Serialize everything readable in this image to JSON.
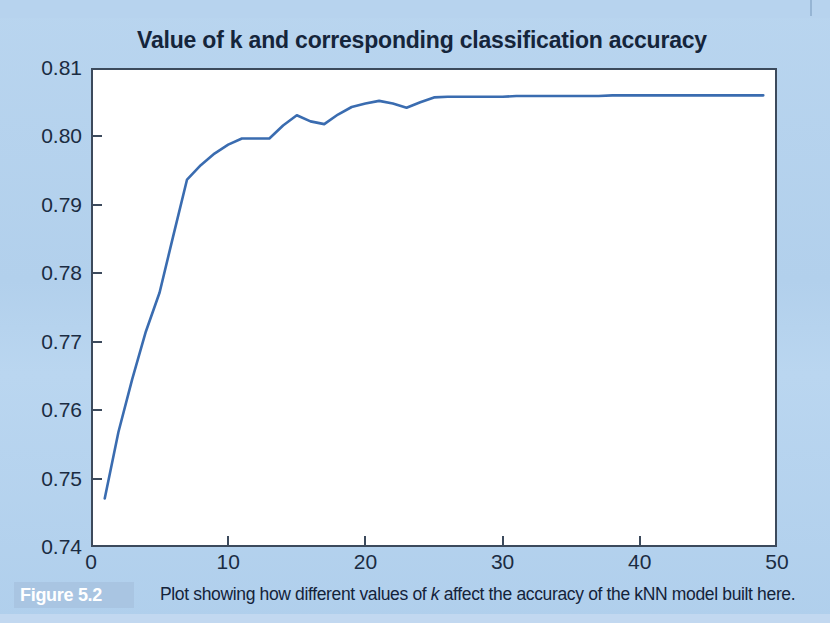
{
  "figure": {
    "tag": "Figure 5.2",
    "caption_before_k": "Plot showing how different values of ",
    "caption_k": "k",
    "caption_after_k": " affect the accuracy of the kNN model built here."
  },
  "colors": {
    "page_background": "#b4d2ee",
    "plot_background": "#ffffff",
    "axis": "#3c4a5c",
    "line": "#3a6cb0",
    "text": "#15253b",
    "figure_tag_background": "#a9c5e2"
  },
  "chart_data": {
    "type": "line",
    "title": "Value of k and corresponding classification accuracy",
    "xlabel": "",
    "ylabel": "",
    "xlim": [
      0,
      50
    ],
    "ylim": [
      0.74,
      0.81
    ],
    "xticks": [
      0,
      10,
      20,
      30,
      40,
      50
    ],
    "xtick_labels": [
      "0",
      "10",
      "20",
      "30",
      "40",
      "50"
    ],
    "yticks": [
      0.74,
      0.75,
      0.76,
      0.77,
      0.78,
      0.79,
      0.8,
      0.81
    ],
    "ytick_labels": [
      "0.74",
      "0.75",
      "0.76",
      "0.77",
      "0.78",
      "0.79",
      "0.80",
      "0.81"
    ],
    "grid": false,
    "legend": null,
    "series": [
      {
        "name": "classification accuracy",
        "color": "#3a6cb0",
        "x": [
          1,
          2,
          3,
          4,
          5,
          6,
          7,
          8,
          9,
          10,
          11,
          12,
          13,
          14,
          15,
          16,
          17,
          18,
          19,
          20,
          21,
          22,
          23,
          24,
          25,
          26,
          27,
          28,
          29,
          30,
          31,
          32,
          33,
          34,
          35,
          36,
          37,
          38,
          39,
          40,
          41,
          42,
          43,
          44,
          45,
          46,
          47,
          48,
          49
        ],
        "y": [
          0.7471,
          0.7568,
          0.7645,
          0.7715,
          0.7772,
          0.7855,
          0.7937,
          0.7958,
          0.7975,
          0.7988,
          0.7997,
          0.7997,
          0.7997,
          0.8016,
          0.8031,
          0.8022,
          0.8018,
          0.8032,
          0.8043,
          0.8048,
          0.8052,
          0.8048,
          0.8042,
          0.805,
          0.8057,
          0.8058,
          0.8058,
          0.8058,
          0.8058,
          0.8058,
          0.8059,
          0.8059,
          0.8059,
          0.8059,
          0.8059,
          0.8059,
          0.8059,
          0.806,
          0.806,
          0.806,
          0.806,
          0.806,
          0.806,
          0.806,
          0.806,
          0.806,
          0.806,
          0.806,
          0.806
        ]
      }
    ]
  }
}
